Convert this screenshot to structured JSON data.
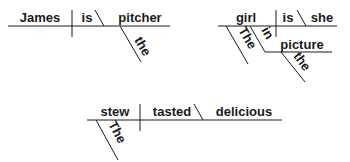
{
  "diagrams": [
    {
      "sentence": "James is the pitcher",
      "subject": "James",
      "verb": "is",
      "complement": "pitcher",
      "modifiers": {
        "pitcher": "the"
      }
    },
    {
      "sentence": "She is the girl in the picture",
      "subject": "girl",
      "verb": "is",
      "complement": "she",
      "modifiers": {
        "girl_article": "The",
        "preposition": "in",
        "object": "picture",
        "object_article": "the"
      }
    },
    {
      "sentence": "The stew tasted delicious",
      "subject": "stew",
      "verb": "tasted",
      "complement": "delicious",
      "modifiers": {
        "stew": "The"
      }
    }
  ],
  "colors": {
    "ink": "#1a1a1a",
    "background": "#ffffff"
  }
}
